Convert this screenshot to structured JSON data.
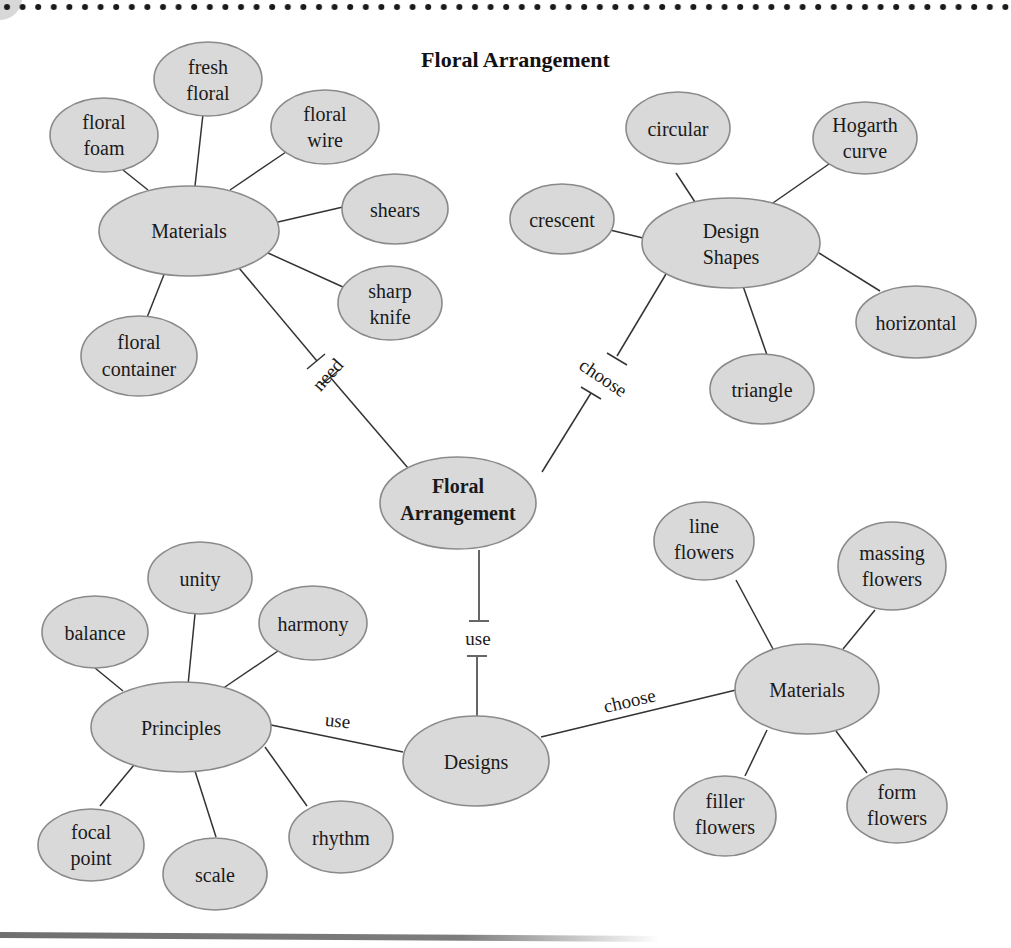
{
  "title": "Floral Arrangement",
  "colors": {
    "node_fill": "#d9d9d9",
    "node_stroke": "#8a8a8a",
    "edge": "#333333",
    "text": "#1a1a1a"
  },
  "center": {
    "label_line1": "Floral",
    "label_line2": "Arrangement"
  },
  "branches": {
    "materials_top": {
      "label": "Materials",
      "link_label": "need",
      "children": [
        {
          "line1": "floral",
          "line2": "foam"
        },
        {
          "line1": "fresh",
          "line2": "floral"
        },
        {
          "line1": "floral",
          "line2": "wire"
        },
        {
          "line1": "shears",
          "line2": ""
        },
        {
          "line1": "sharp",
          "line2": "knife"
        },
        {
          "line1": "floral",
          "line2": "container"
        }
      ]
    },
    "design_shapes": {
      "label_line1": "Design",
      "label_line2": "Shapes",
      "link_label": "choose",
      "children": [
        {
          "line1": "circular",
          "line2": ""
        },
        {
          "line1": "Hogarth",
          "line2": "curve"
        },
        {
          "line1": "crescent",
          "line2": ""
        },
        {
          "line1": "horizontal",
          "line2": ""
        },
        {
          "line1": "triangle",
          "line2": ""
        }
      ]
    },
    "designs": {
      "label": "Designs",
      "link_label": "use",
      "principles": {
        "label": "Principles",
        "link_label": "use",
        "children": [
          {
            "line1": "balance",
            "line2": ""
          },
          {
            "line1": "unity",
            "line2": ""
          },
          {
            "line1": "harmony",
            "line2": ""
          },
          {
            "line1": "rhythm",
            "line2": ""
          },
          {
            "line1": "scale",
            "line2": ""
          },
          {
            "line1": "focal",
            "line2": "point"
          }
        ]
      },
      "materials_bottom": {
        "label": "Materials",
        "link_label": "choose",
        "children": [
          {
            "line1": "line",
            "line2": "flowers"
          },
          {
            "line1": "massing",
            "line2": "flowers"
          },
          {
            "line1": "filler",
            "line2": "flowers"
          },
          {
            "line1": "form",
            "line2": "flowers"
          }
        ]
      }
    }
  }
}
